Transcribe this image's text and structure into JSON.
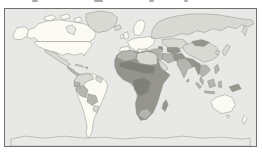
{
  "figure": {
    "type": "world-choropleth-map",
    "frame_color": "#707070",
    "ocean_color": "#e8e8e6",
    "coastline_color": "#84847e",
    "graticule_color": "#d8d8d5",
    "palette": {
      "very_light": "#fbfbf3",
      "light": "#d9d9d3",
      "medium": "#b5b5af",
      "dark": "#95958e",
      "very_dark": "#80807a",
      "ocean_like": "#e8e8e6"
    },
    "regions": [
      {
        "id": "antarctica",
        "shade": "ocean_like"
      },
      {
        "id": "alaska",
        "shade": "very_light"
      },
      {
        "id": "canada",
        "shade": "very_light"
      },
      {
        "id": "hudson-bay",
        "shade": "ocean_like"
      },
      {
        "id": "arctic-island-1",
        "shade": "very_light"
      },
      {
        "id": "arctic-island-2",
        "shade": "very_light"
      },
      {
        "id": "arctic-island-3",
        "shade": "very_light"
      },
      {
        "id": "greenland",
        "shade": "light"
      },
      {
        "id": "usa",
        "shade": "very_light"
      },
      {
        "id": "mexico",
        "shade": "light"
      },
      {
        "id": "central-america",
        "shade": "medium"
      },
      {
        "id": "cuba",
        "shade": "light"
      },
      {
        "id": "hispaniola",
        "shade": "medium"
      },
      {
        "id": "south-america-base",
        "shade": "very_light"
      },
      {
        "id": "colombia-venezuela",
        "shade": "light"
      },
      {
        "id": "guyanas",
        "shade": "light"
      },
      {
        "id": "ecuador",
        "shade": "medium"
      },
      {
        "id": "peru",
        "shade": "medium"
      },
      {
        "id": "bolivia",
        "shade": "medium"
      },
      {
        "id": "paraguay",
        "shade": "light"
      },
      {
        "id": "iceland",
        "shade": "light"
      },
      {
        "id": "uk",
        "shade": "very_light"
      },
      {
        "id": "ireland",
        "shade": "very_light"
      },
      {
        "id": "scandinavia",
        "shade": "very_light"
      },
      {
        "id": "europe-mainland",
        "shade": "very_light"
      },
      {
        "id": "iberia",
        "shade": "very_light"
      },
      {
        "id": "italy",
        "shade": "very_light"
      },
      {
        "id": "balkans",
        "shade": "very_light"
      },
      {
        "id": "russia",
        "shade": "light"
      },
      {
        "id": "kamchatka",
        "shade": "light"
      },
      {
        "id": "kazakhstan",
        "shade": "light"
      },
      {
        "id": "central-asia",
        "shade": "dark"
      },
      {
        "id": "caucasus",
        "shade": "dark"
      },
      {
        "id": "turkey",
        "shade": "medium"
      },
      {
        "id": "syria-iraq",
        "shade": "medium"
      },
      {
        "id": "iran",
        "shade": "medium"
      },
      {
        "id": "afghanistan-pakistan",
        "shade": "dark"
      },
      {
        "id": "saudi-arabia",
        "shade": "light"
      },
      {
        "id": "yemen",
        "shade": "dark"
      },
      {
        "id": "india",
        "shade": "medium"
      },
      {
        "id": "himalaya-bengal",
        "shade": "dark"
      },
      {
        "id": "sri-lanka",
        "shade": "medium"
      },
      {
        "id": "china",
        "shade": "light"
      },
      {
        "id": "mongolia",
        "shade": "dark"
      },
      {
        "id": "korea",
        "shade": "light"
      },
      {
        "id": "japan",
        "shade": "light"
      },
      {
        "id": "myanmar",
        "shade": "dark"
      },
      {
        "id": "indochina",
        "shade": "medium"
      },
      {
        "id": "malay-peninsula",
        "shade": "medium"
      },
      {
        "id": "sumatra",
        "shade": "medium"
      },
      {
        "id": "java",
        "shade": "medium"
      },
      {
        "id": "borneo",
        "shade": "medium"
      },
      {
        "id": "sulawesi",
        "shade": "medium"
      },
      {
        "id": "philippines",
        "shade": "medium"
      },
      {
        "id": "papua-new-guinea",
        "shade": "dark"
      },
      {
        "id": "australia",
        "shade": "very_light"
      },
      {
        "id": "tasmania",
        "shade": "very_light"
      },
      {
        "id": "new-zealand",
        "shade": "very_light"
      },
      {
        "id": "africa-base",
        "shade": "dark"
      },
      {
        "id": "maghreb",
        "shade": "medium"
      },
      {
        "id": "libya-egypt",
        "shade": "light"
      },
      {
        "id": "sahel-band",
        "shade": "very_dark"
      },
      {
        "id": "central-africa",
        "shade": "very_dark"
      },
      {
        "id": "south-africa",
        "shade": "medium"
      },
      {
        "id": "madagascar",
        "shade": "dark"
      }
    ]
  }
}
